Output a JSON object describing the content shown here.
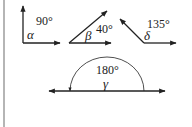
{
  "diagram": {
    "angles": [
      {
        "symbol": "α",
        "measure_label": "90°",
        "measure_deg": 90,
        "type": "right"
      },
      {
        "symbol": "β",
        "measure_label": "40°",
        "measure_deg": 40,
        "type": "acute"
      },
      {
        "symbol": "δ",
        "measure_label": "135°",
        "measure_deg": 135,
        "type": "obtuse"
      },
      {
        "symbol": "γ",
        "measure_label": "180°",
        "measure_deg": 180,
        "type": "straight"
      }
    ],
    "colors": {
      "stroke": "#222222",
      "border": "#b5b5b5",
      "background": "#ffffff"
    }
  }
}
